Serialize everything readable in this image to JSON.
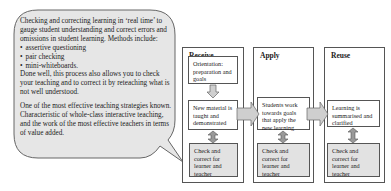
{
  "bubble": {
    "intro": "Checking and correcting learning in ‘real time’ to gauge student understanding and correct errors and omissions in student learning. Methods include:",
    "methods": [
      "assertive questioning",
      "pair checking",
      "mini-whiteboards."
    ],
    "after_methods": "Done well, this process also allows you to check your teaching and to correct it by reteaching what is not well understood.",
    "closing": "One of the most effective teaching strategies known. Characteristic of whole-class interactive teaching, and the work of the most effective teachers in terms of value added."
  },
  "stages": [
    {
      "title": "Receive",
      "boxes": [
        "Orientation: preparation and goals",
        "New material is taught and demonstrated"
      ],
      "check": "Check and correct for learner and teacher"
    },
    {
      "title": "Apply",
      "boxes": [
        "Students work towards goals that apply the new learning"
      ],
      "check": "Check and correct for learner and teacher"
    },
    {
      "title": "Reuse",
      "boxes": [
        "Learning is summarised and clarified"
      ],
      "check": "Check and correct for learner and teacher"
    }
  ],
  "colors": {
    "bubble_fill": "#e6e6e6",
    "check_fill": "#e2e2e2",
    "arrow_fill": "#cfcfcf",
    "border": "#555555"
  }
}
